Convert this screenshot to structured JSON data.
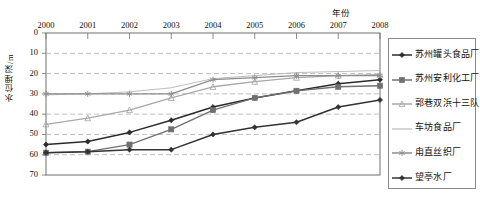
{
  "chart_data": {
    "type": "line",
    "title": "",
    "xlabel": "年份",
    "ylabel": "水位埋深/m",
    "categories": [
      "2000",
      "2001",
      "2002",
      "2003",
      "2004",
      "2005",
      "2006",
      "2007",
      "2008"
    ],
    "xlim": [
      2000,
      2008
    ],
    "ylim": [
      0,
      70
    ],
    "y_inverted": true,
    "y_ticks": [
      "0",
      "10",
      "20",
      "30",
      "40",
      "50",
      "60",
      "70"
    ],
    "grid": "horizontal-dashed",
    "legend_position": "right-outside",
    "series": [
      {
        "name": "苏州罐头食品厂",
        "marker": "diamond",
        "color": "#2b2b2b",
        "values": [
          55,
          53.5,
          49,
          43,
          36.5,
          32,
          28.5,
          25,
          23
        ]
      },
      {
        "name": "苏州安利化工厂",
        "marker": "square",
        "color": "#707070",
        "values": [
          59,
          58.5,
          55,
          47.5,
          38,
          32,
          28.5,
          26.5,
          26
        ]
      },
      {
        "name": "郭巷双浜十三队",
        "marker": "triangle",
        "color": "#a8a8a8",
        "values": [
          45,
          42,
          38,
          32,
          26.5,
          24,
          22,
          21,
          20.5
        ]
      },
      {
        "name": "车坊食品厂",
        "marker": "none",
        "color": "#b5b5b5",
        "values": [
          30.5,
          30,
          29,
          27,
          22.5,
          21,
          19.5,
          19,
          18.5
        ]
      },
      {
        "name": "甪直丝织厂",
        "marker": "asterisk",
        "color": "#8c8c8c",
        "values": [
          30,
          30,
          30,
          30,
          23,
          22,
          21,
          21,
          21
        ]
      },
      {
        "name": "望亭水厂",
        "marker": "diamond",
        "color": "#333333",
        "values": [
          59,
          58.5,
          57.5,
          57.5,
          50,
          46.5,
          44,
          36.5,
          33
        ]
      }
    ]
  },
  "legend": {
    "items": [
      {
        "label": "苏州罐头食品厂"
      },
      {
        "label": "苏州安利化工厂"
      },
      {
        "label": "郭巷双浜十三队"
      },
      {
        "label": "车坊食品厂"
      },
      {
        "label": "甪直丝织厂"
      },
      {
        "label": "望亭水厂"
      }
    ]
  }
}
